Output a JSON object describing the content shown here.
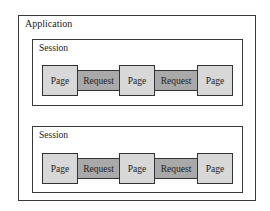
{
  "diagram": {
    "title": "Application",
    "colors": {
      "border": "#333333",
      "page_fill": "#d8d8d8",
      "request_fill": "#a9a9a9",
      "background": "#ffffff"
    },
    "sessions": [
      {
        "label": "Session",
        "flow": [
          {
            "type": "page",
            "label": "Page"
          },
          {
            "type": "request",
            "label": "Request"
          },
          {
            "type": "page",
            "label": "Page"
          },
          {
            "type": "request",
            "label": "Request"
          },
          {
            "type": "page",
            "label": "Page"
          }
        ]
      },
      {
        "label": "Session",
        "flow": [
          {
            "type": "page",
            "label": "Page"
          },
          {
            "type": "request",
            "label": "Request"
          },
          {
            "type": "page",
            "label": "Page"
          },
          {
            "type": "request",
            "label": "Request"
          },
          {
            "type": "page",
            "label": "Page"
          }
        ]
      }
    ]
  }
}
